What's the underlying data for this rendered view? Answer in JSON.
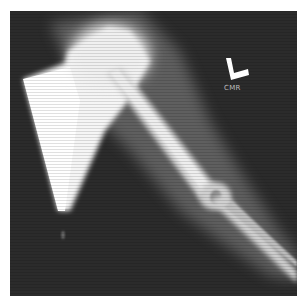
{
  "image": {
    "subject": "arm-xray",
    "side_marker": "L",
    "label": "CMR",
    "colors": {
      "background": "#2a2a2a",
      "bone": "#f2f2f2",
      "soft_tissue": "#9a9a9a",
      "marker": "#ffffff",
      "label": "#bdbdbd"
    }
  }
}
